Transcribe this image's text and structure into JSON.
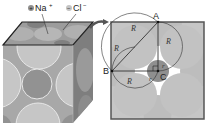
{
  "figure": {
    "legend": [
      {
        "symbol": "+",
        "label": "Na",
        "charge": "+",
        "color": "#8a8a8a"
      },
      {
        "symbol": "−",
        "label": "Cl",
        "charge": "−",
        "color": "#c4c4c4"
      }
    ],
    "points": {
      "A": "A",
      "B": "B",
      "C": "C"
    },
    "radius_labels": {
      "R1": "R",
      "R2": "R",
      "R3": "R",
      "R4": "R",
      "r1": "r",
      "r2": "r"
    },
    "colors": {
      "large_ion": "#c6c6c6",
      "small_ion": "#8f8f8f",
      "face": "#a9a9a9",
      "top_face": "#9a9a9a",
      "gap": "#ffffff",
      "outline": "#222222",
      "arrow": "#555555"
    }
  }
}
